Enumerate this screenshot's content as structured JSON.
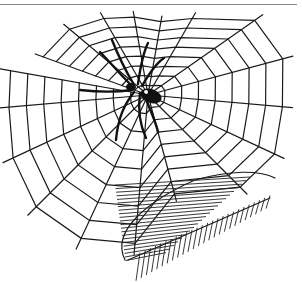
{
  "illustration": {
    "subject": "Spider on a web with a leaf",
    "elements": [
      "spider",
      "spider-web",
      "leaf"
    ],
    "style": "black ink line drawing on white",
    "colors": {
      "ink": "#1a1a1a",
      "background": "#ffffff",
      "frame_line": "#888888"
    }
  }
}
